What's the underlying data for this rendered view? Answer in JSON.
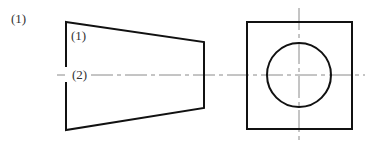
{
  "figure": {
    "problem_label": "(1)",
    "front_view": {
      "label_top": "(1)",
      "label_middle": "(2)"
    },
    "colors": {
      "outline": "#111111",
      "center_line": "#888888",
      "text": "#333333"
    }
  }
}
